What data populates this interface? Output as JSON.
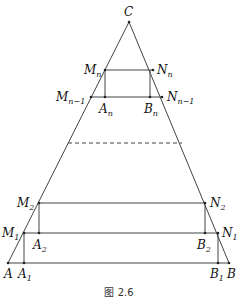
{
  "figure": {
    "caption": "图 2.6",
    "apex": {
      "name": "C",
      "x": 129,
      "y": 22
    },
    "base": {
      "y": 263,
      "left": {
        "name": "A",
        "x": 8
      },
      "right": {
        "name": "B",
        "x": 229
      }
    },
    "line_color": "#444444",
    "dashed_line": {
      "y": 143,
      "x1": 68,
      "x2": 182
    },
    "labels": {
      "C": "C",
      "Mn": {
        "main": "M",
        "sub": "n"
      },
      "Nn": {
        "main": "N",
        "sub": "n"
      },
      "Mn1": {
        "main": "M",
        "sub": "n−1"
      },
      "Nn1": {
        "main": "N",
        "sub": "n−1"
      },
      "An": {
        "main": "A",
        "sub": "n"
      },
      "Bn": {
        "main": "B",
        "sub": "n"
      },
      "M2": {
        "main": "M",
        "sub": "2"
      },
      "N2": {
        "main": "N",
        "sub": "2"
      },
      "M1": {
        "main": "M",
        "sub": "1"
      },
      "N1": {
        "main": "N",
        "sub": "1"
      },
      "A2": {
        "main": "A",
        "sub": "2"
      },
      "B2": {
        "main": "B",
        "sub": "2"
      },
      "A": "A",
      "A1": {
        "main": "A",
        "sub": "1"
      },
      "B1": {
        "main": "B",
        "sub": "1"
      },
      "B": "B"
    }
  }
}
